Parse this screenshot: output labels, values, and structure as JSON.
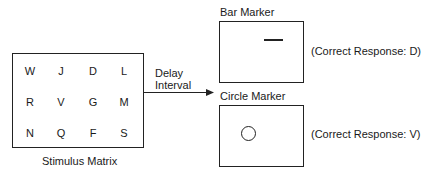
{
  "stimulus": {
    "caption": "Stimulus Matrix",
    "rows": [
      [
        "W",
        "J",
        "D",
        "L"
      ],
      [
        "R",
        "V",
        "G",
        "M"
      ],
      [
        "N",
        "Q",
        "F",
        "S"
      ]
    ]
  },
  "delay": {
    "line1": "Delay",
    "line2": "Interval"
  },
  "bar_marker": {
    "title": "Bar Marker",
    "response": "(Correct Response: D)"
  },
  "circle_marker": {
    "title": "Circle Marker",
    "response": "(Correct Response: V)"
  }
}
